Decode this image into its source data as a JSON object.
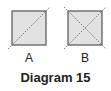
{
  "diagram": {
    "caption": "Diagram 15",
    "colors": {
      "fill": "#e2e2e2",
      "border": "#555555",
      "diagonal": "#777777",
      "text": "#222222"
    },
    "panels": [
      {
        "label": "A",
        "square": {
          "x": 12,
          "y": 11,
          "size": 34
        },
        "diagonals": [
          "bottom-left-to-top-right"
        ]
      },
      {
        "label": "B",
        "square": {
          "x": 68,
          "y": 11,
          "size": 34
        },
        "diagonals": [
          "bottom-left-to-top-right",
          "top-left-to-bottom-right"
        ]
      }
    ]
  }
}
